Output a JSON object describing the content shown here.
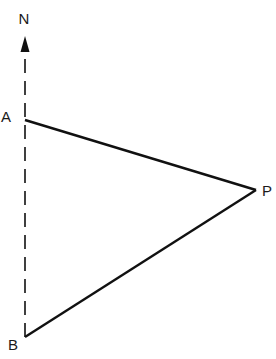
{
  "diagram": {
    "labels": {
      "north": "N",
      "a": "A",
      "b": "B",
      "p": "P"
    },
    "points": {
      "N_arrow_tip": [
        24,
        36
      ],
      "A": [
        25,
        120
      ],
      "P": [
        256,
        190
      ],
      "B": [
        25,
        337
      ]
    },
    "colors": {
      "line": "#111111",
      "background": "#ffffff"
    }
  }
}
